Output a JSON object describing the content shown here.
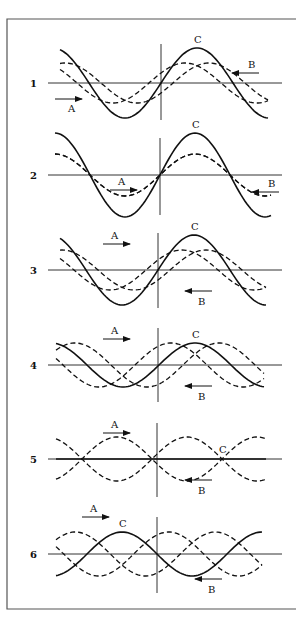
{
  "figure": {
    "panels": [
      {
        "number": "1",
        "label_A": "A",
        "label_B": "B",
        "label_C": "C",
        "axis_y": 83,
        "vline_x": 161,
        "vline_top": 44,
        "vline_bottom": 120,
        "ampC": 35,
        "ampAB": 20,
        "phaseA": -30,
        "phaseB": 30,
        "start_x": 60,
        "end_x": 268,
        "wavelength": 144,
        "peak_x": 197
      },
      {
        "number": "2",
        "label_A": "A",
        "label_B": "B",
        "label_C": "C",
        "axis_y": 175,
        "vline_x": 160,
        "vline_top": 138,
        "vline_bottom": 215,
        "ampC": 42,
        "ampAB": 21,
        "phaseA": 0,
        "phaseB": 0,
        "start_x": 55,
        "end_x": 272,
        "wavelength": 140,
        "peak_x": 195
      },
      {
        "number": "3",
        "label_A": "A",
        "label_B": "B",
        "label_C": "C",
        "axis_y": 270,
        "vline_x": 158,
        "vline_top": 233,
        "vline_bottom": 308,
        "ampC": 35,
        "ampAB": 20,
        "phaseA": 30,
        "phaseB": -30,
        "start_x": 60,
        "end_x": 266,
        "wavelength": 144,
        "peak_x": 194
      },
      {
        "number": "4",
        "label_A": "A",
        "label_B": "B",
        "label_C": "C",
        "axis_y": 365,
        "vline_x": 158,
        "vline_top": 328,
        "vline_bottom": 402,
        "ampC": 22,
        "ampAB": 22,
        "phaseA": 60,
        "phaseB": -60,
        "start_x": 56,
        "end_x": 264,
        "wavelength": 144,
        "peak_x": 195
      },
      {
        "number": "5",
        "label_A": "A",
        "label_B": "B",
        "label_C": "C",
        "axis_y": 459,
        "vline_x": 157,
        "vline_top": 423,
        "vline_bottom": 497,
        "ampC": 0,
        "ampAB": 22,
        "phaseA": 90,
        "phaseB": -90,
        "start_x": 56,
        "end_x": 266,
        "wavelength": 140,
        "peak_x": 222
      },
      {
        "number": "6",
        "label_A": "A",
        "label_B": "B",
        "label_C": "C",
        "axis_y": 554,
        "vline_x": 157,
        "vline_top": 517,
        "vline_bottom": 593,
        "ampC": 22,
        "ampAB": 22,
        "phaseA": 120,
        "phaseB": -120,
        "start_x": 56,
        "end_x": 262,
        "wavelength": 140,
        "peak_x": 122
      }
    ]
  }
}
